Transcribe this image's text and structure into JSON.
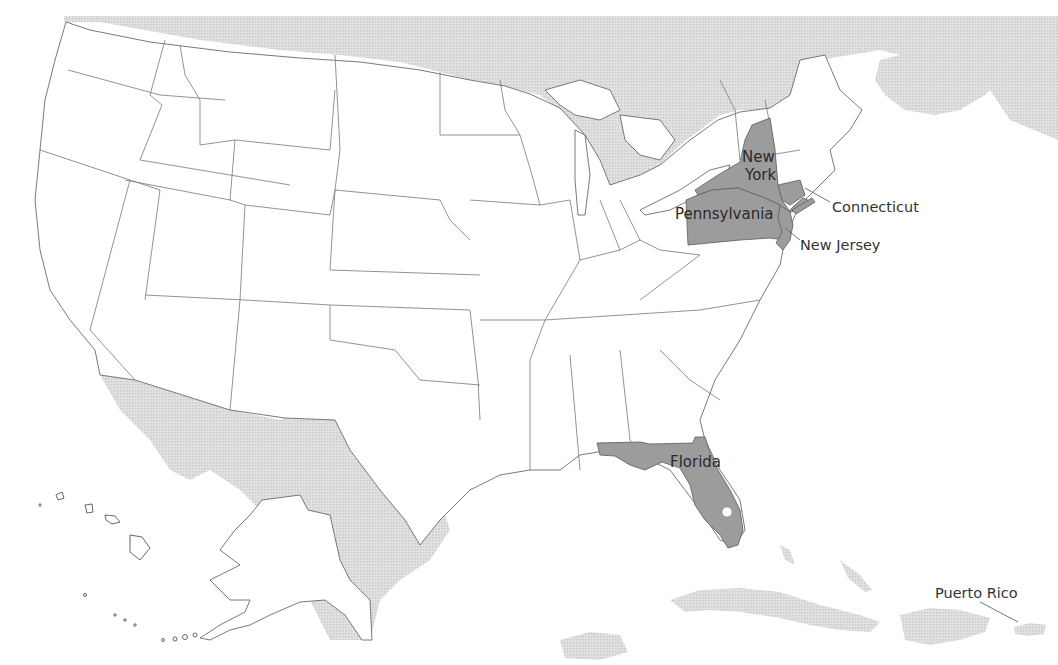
{
  "map": {
    "title": "",
    "highlight_color": "#9c9c9c",
    "foreign_land_color": "#d9d9d9",
    "state_fill": "#ffffff",
    "border_color": "#6a6a6a",
    "highlighted_states": [
      "New York",
      "Pennsylvania",
      "Connecticut",
      "New Jersey",
      "Florida"
    ],
    "labels": {
      "new_york_1": "New",
      "new_york_2": "York",
      "pennsylvania": "Pennsylvania",
      "connecticut": "Connecticut",
      "new_jersey": "New Jersey",
      "florida": "Florida",
      "puerto_rico": "Puerto Rico"
    },
    "insets": [
      "Alaska",
      "Hawaii",
      "Puerto Rico"
    ]
  }
}
